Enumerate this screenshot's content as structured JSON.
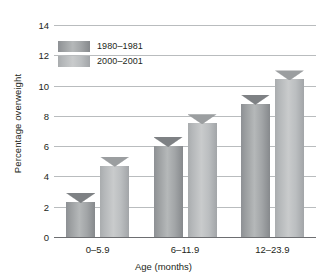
{
  "chart_data": {
    "type": "bar",
    "title": "",
    "xlabel": "Age (months)",
    "ylabel": "Percentage overweight",
    "categories": [
      "0–5.9",
      "6–11.9",
      "12–23.9"
    ],
    "series": [
      {
        "name": "1980–1981",
        "values": [
          2.9,
          6.6,
          9.4
        ],
        "color": "#9a9d9f"
      },
      {
        "name": "2000–2001",
        "values": [
          5.3,
          8.1,
          11.0
        ],
        "color": "#c0c3c5"
      }
    ],
    "ylim": [
      0,
      14
    ],
    "yticks": [
      0,
      2,
      4,
      6,
      8,
      10,
      12,
      14
    ],
    "ytick_labels": [
      "0",
      "2",
      "4",
      "6",
      "8",
      "10",
      "12",
      "14"
    ],
    "grid": true,
    "grid_orientation": "horizontal",
    "legend_position": "top-left-inside",
    "legend_entries": [
      "1980–1981",
      "2000–2001"
    ],
    "bar_style": "3d-gradient",
    "background_color": "#ffffff",
    "gridline_color": "#b9bcbe",
    "axis_color": "#6d6e71",
    "text_color": "#231f20"
  }
}
